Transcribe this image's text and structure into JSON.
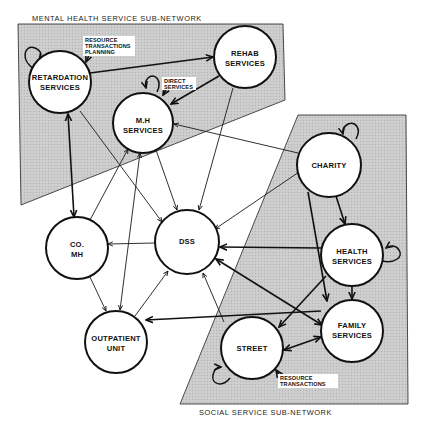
{
  "diagram": {
    "title_top": "MENTAL HEALTH SERVICE SUB-NETWORK",
    "title_bottom": "SOCIAL SERVICE SUB-NETWORK",
    "subnetworks": [
      {
        "name": "MENTAL HEALTH SERVICE SUB-NETWORK",
        "members": [
          "retardation",
          "rehab",
          "mh"
        ]
      },
      {
        "name": "SOCIAL SERVICE SUB-NETWORK",
        "members": [
          "charity",
          "health",
          "family",
          "street"
        ]
      }
    ],
    "nodes": {
      "retardation": {
        "lines": [
          "RETARDATION",
          "SERVICES"
        ],
        "self_loop": true
      },
      "rehab": {
        "lines": [
          "REHAB",
          "SERVICES"
        ],
        "self_loop": false
      },
      "mh": {
        "lines": [
          "M.H",
          "SERVICES"
        ],
        "self_loop": true
      },
      "charity": {
        "lines": [
          "CHARITY"
        ],
        "self_loop": true
      },
      "health": {
        "lines": [
          "HEALTH",
          "SERVICES"
        ],
        "self_loop": true
      },
      "family": {
        "lines": [
          "FAMILY",
          "SERVICES"
        ],
        "self_loop": false
      },
      "street": {
        "lines": [
          "STREET"
        ],
        "self_loop": true
      },
      "comh": {
        "lines": [
          "CO.",
          "MH"
        ],
        "self_loop": false
      },
      "dss": {
        "lines": [
          "DSS"
        ],
        "self_loop": false
      },
      "outpatient": {
        "lines": [
          "OUTPATIENT",
          "UNIT"
        ],
        "self_loop": false
      }
    },
    "annotations": {
      "planning": {
        "lines": [
          "RESOURCE",
          "TRANSACTIONS",
          "PLANNING"
        ],
        "target": "retardation"
      },
      "direct": {
        "lines": [
          "DIRECT",
          "SERVICES"
        ],
        "target": "mh"
      },
      "resource": {
        "lines": [
          "RESOURCE",
          "TRANSACTIONS"
        ],
        "target": "street"
      }
    },
    "edges": [
      {
        "from": "retardation",
        "to": "rehab",
        "direction": "forward"
      },
      {
        "from": "rehab",
        "to": "mh",
        "direction": "forward"
      },
      {
        "from": "retardation",
        "to": "comh",
        "direction": "both"
      },
      {
        "from": "retardation",
        "to": "dss",
        "direction": "forward"
      },
      {
        "from": "comh",
        "to": "mh",
        "direction": "forward"
      },
      {
        "from": "outpatient",
        "to": "mh",
        "direction": "both"
      },
      {
        "from": "mh",
        "to": "dss",
        "direction": "forward"
      },
      {
        "from": "rehab",
        "to": "dss",
        "direction": "forward"
      },
      {
        "from": "charity",
        "to": "mh",
        "direction": "forward"
      },
      {
        "from": "charity",
        "to": "dss",
        "direction": "forward"
      },
      {
        "from": "health",
        "to": "dss",
        "direction": "forward"
      },
      {
        "from": "dss",
        "to": "family",
        "direction": "both"
      },
      {
        "from": "street",
        "to": "dss",
        "direction": "forward"
      },
      {
        "from": "outpatient",
        "to": "dss",
        "direction": "forward"
      },
      {
        "from": "dss",
        "to": "comh",
        "direction": "forward"
      },
      {
        "from": "comh",
        "to": "outpatient",
        "direction": "forward"
      },
      {
        "from": "family",
        "to": "outpatient",
        "direction": "forward"
      },
      {
        "from": "charity",
        "to": "health",
        "direction": "forward"
      },
      {
        "from": "charity",
        "to": "family",
        "direction": "forward"
      },
      {
        "from": "health",
        "to": "family",
        "direction": "forward"
      },
      {
        "from": "health",
        "to": "street",
        "direction": "forward"
      },
      {
        "from": "street",
        "to": "family",
        "direction": "both"
      }
    ]
  },
  "colors": {
    "region_fill": "#c9c9c9",
    "node_fill": "#ffffff",
    "stroke": "#111111",
    "background": "#ffffff"
  }
}
